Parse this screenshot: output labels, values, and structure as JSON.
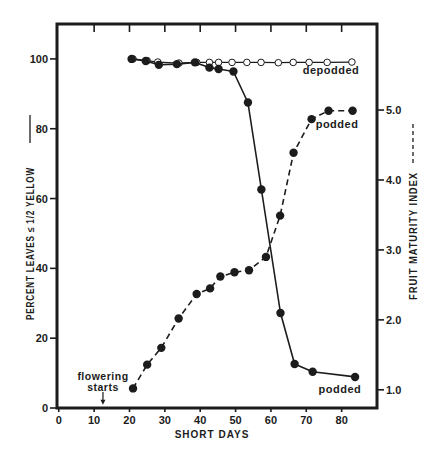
{
  "chart_data": {
    "type": "line",
    "title": "",
    "xlabel": "SHORT DAYS",
    "ylabel": "PERCENT LEAVES ≤ 1/2 YELLOW",
    "ylabel_line_style": "solid",
    "y2label": "FRUIT MATURITY INDEX",
    "y2label_line_style": "dashed",
    "grid": false,
    "legend": "none (series labelled inline)",
    "xlim": [
      -0.5,
      90
    ],
    "ylim": [
      0,
      110
    ],
    "y2lim": [
      0.74,
      6.23
    ],
    "xticks": [
      0,
      10,
      20,
      30,
      40,
      50,
      60,
      70,
      80
    ],
    "xtick_labels": [
      "0",
      "10",
      "20",
      "30",
      "40",
      "50",
      "60",
      "70",
      "80"
    ],
    "top_ticks": [
      10,
      20,
      30,
      40,
      50,
      60,
      70,
      80
    ],
    "yticks": [
      0,
      20,
      40,
      60,
      80,
      100
    ],
    "ytick_labels": [
      "0",
      "20",
      "40",
      "60",
      "80",
      "100"
    ],
    "y2ticks": [
      1,
      2,
      3,
      4,
      5
    ],
    "y2tick_labels": [
      "1.0",
      "2.0",
      "3.0",
      "4.0",
      "5.0"
    ],
    "series": [
      {
        "name": "depodded - percent leaves ≤ 1/2 yellow",
        "axis": "left",
        "line": "solid",
        "marker": "open-circle",
        "x": [
          21,
          25,
          28,
          34,
          39,
          42.6,
          45.2,
          49,
          53.2,
          57.2,
          62.1,
          66.3,
          70.8,
          75.9,
          82.9
        ],
        "y": [
          100,
          99.5,
          99.1,
          98.8,
          99,
          99,
          99,
          99,
          99,
          99,
          98.9,
          99,
          99,
          99,
          99.1
        ]
      },
      {
        "name": "podded - percent leaves ≤ 1/2 yellow",
        "axis": "left",
        "line": "solid",
        "marker": "filled-circle",
        "x": [
          20.6,
          24.6,
          28.3,
          33.4,
          38.5,
          42.6,
          45.2,
          49.4,
          53.5,
          57.3,
          62.7,
          66.7,
          71.8,
          83.8
        ],
        "y": [
          100,
          99.4,
          98.3,
          98.5,
          99,
          97.5,
          97.1,
          96.4,
          87.5,
          62.6,
          27.2,
          12.6,
          10.4,
          8.9
        ]
      },
      {
        "name": "podded - fruit maturity index",
        "axis": "right",
        "line": "dashed",
        "marker": "filled-circle",
        "x": [
          21,
          25,
          29,
          33.9,
          39,
          42.8,
          45.7,
          49.7,
          53.8,
          58.6,
          62.6,
          66.4,
          71.5,
          76.3,
          83.1
        ],
        "y": [
          1.02,
          1.36,
          1.6,
          2.02,
          2.37,
          2.45,
          2.62,
          2.68,
          2.71,
          2.9,
          3.49,
          4.39,
          4.87,
          4.99,
          4.99
        ]
      }
    ],
    "annotations": [
      {
        "id": "label-depodded",
        "text": "depodded",
        "x": 77,
        "y": 96.8,
        "axis": "left"
      },
      {
        "id": "label-podded-index",
        "text": "podded",
        "x": 78.7,
        "y": 4.8,
        "axis": "right"
      },
      {
        "id": "label-podded-leaves",
        "text": "podded",
        "x": 79.5,
        "y": 5.4,
        "axis": "left"
      },
      {
        "id": "flowering-starts",
        "text_lines": [
          "flowering",
          "starts"
        ],
        "x": 12.5,
        "text_y": [
          9.2,
          6.0
        ],
        "arrow_from": 4.6,
        "arrow_to": 0.9,
        "axis": "left"
      }
    ]
  },
  "colors": {
    "background": "#ffffff",
    "ink": "#1c1c1c"
  }
}
